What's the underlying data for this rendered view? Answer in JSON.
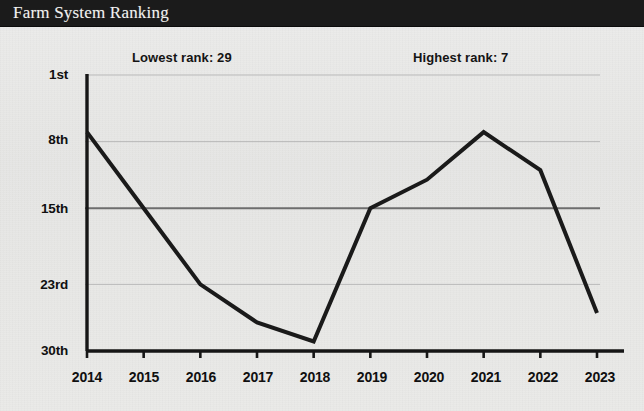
{
  "titlebar": {
    "title": "Farm System Ranking",
    "background_color": "#1b1b1b",
    "text_color": "#f2f2f0"
  },
  "annotations": {
    "lowest": "Lowest rank: 29",
    "highest": "Highest rank: 7"
  },
  "chart_data": {
    "type": "line",
    "title": "Farm System Ranking",
    "xlabel": "",
    "ylabel": "",
    "categories": [
      "2014",
      "2015",
      "2016",
      "2017",
      "2018",
      "2019",
      "2020",
      "2021",
      "2022",
      "2023"
    ],
    "values": [
      7,
      15,
      23,
      27,
      29,
      15,
      12,
      7,
      11,
      26
    ],
    "series": [
      {
        "name": "Farm System Ranking",
        "values": [
          7,
          15,
          23,
          27,
          29,
          15,
          12,
          7,
          11,
          26
        ],
        "color": "#1a1a1a",
        "line_width": 4
      }
    ],
    "y_tick_labels": [
      "1st",
      "8th",
      "15th",
      "23rd",
      "30th"
    ],
    "y_tick_values": [
      1,
      8,
      15,
      23,
      30
    ],
    "ylim": [
      1,
      30
    ],
    "y_axis_inverted": true,
    "x_tick_labels": [
      "2014",
      "2015",
      "2016",
      "2017",
      "2018",
      "2019",
      "2020",
      "2021",
      "2022",
      "2023"
    ],
    "grid": true,
    "gridline_color": "#b9b9b9",
    "emphasis_gridline": "15th",
    "emphasis_gridline_color": "#6d6d6d",
    "legend": null,
    "legend_position": "none",
    "annotations": [
      {
        "text": "Lowest rank: 29",
        "refers_to_year": "2018",
        "value": 29
      },
      {
        "text": "Highest rank: 7",
        "refers_to_year": "2021",
        "value": 7
      }
    ],
    "background_color": "#e9e9e7",
    "axis_color": "#161616"
  }
}
